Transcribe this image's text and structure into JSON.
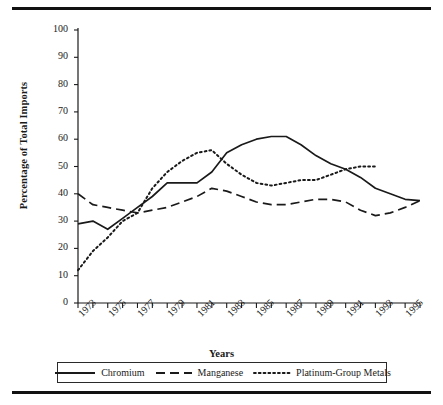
{
  "figure": {
    "top_rule": "",
    "bottom_rule": ""
  },
  "chart_data": {
    "type": "line",
    "title": "",
    "xlabel": "Years",
    "ylabel": "Percentage of Total Imports",
    "ylim": [
      0,
      100
    ],
    "ytick_step": 10,
    "yticks": [
      "100",
      "90",
      "80",
      "70",
      "60",
      "50",
      "40",
      "30",
      "20",
      "10",
      "0"
    ],
    "xlim": [
      1973,
      1996
    ],
    "xticks_labeled": [
      "1973",
      "1975",
      "1977",
      "1979",
      "1981",
      "1983",
      "1985",
      "1987",
      "1989",
      "1991",
      "1993",
      "1995"
    ],
    "x": [
      1973,
      1974,
      1975,
      1976,
      1977,
      1978,
      1979,
      1980,
      1981,
      1982,
      1983,
      1984,
      1985,
      1986,
      1987,
      1988,
      1989,
      1990,
      1991,
      1992,
      1993,
      1994,
      1995,
      1996
    ],
    "grid": false,
    "legend_position": "bottom",
    "series": [
      {
        "name": "Chromium",
        "style": "solid",
        "color": "#1a1a1a",
        "values": [
          29,
          30,
          27,
          31,
          35,
          39,
          44,
          44,
          44,
          48,
          55,
          58,
          60,
          61,
          61,
          58,
          54,
          51,
          49,
          46,
          42,
          40,
          38,
          37.5
        ]
      },
      {
        "name": "Manganese",
        "style": "dashed",
        "color": "#1a1a1a",
        "values": [
          40,
          36,
          35,
          34,
          33,
          34,
          35,
          37,
          39,
          42,
          41,
          39,
          37,
          36,
          36,
          37,
          38,
          38,
          37,
          34,
          32,
          33,
          35,
          37.5
        ]
      },
      {
        "name": "Platinum-Group Metals",
        "style": "dotted",
        "color": "#1a1a1a",
        "values": [
          12,
          19,
          24,
          30,
          33,
          42,
          48,
          52,
          55,
          56,
          51,
          47,
          44,
          43,
          44,
          45,
          45,
          47,
          49,
          50,
          50,
          null,
          null,
          null
        ]
      }
    ]
  },
  "legend": {
    "entries": [
      {
        "label": "Chromium",
        "style": "solid"
      },
      {
        "label": "Manganese",
        "style": "dashed"
      },
      {
        "label": "Platinum-Group Metals",
        "style": "dotted"
      }
    ]
  }
}
